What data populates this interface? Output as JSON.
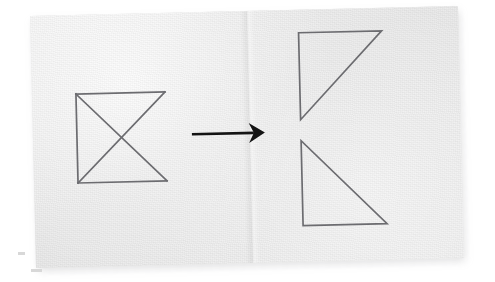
{
  "scene": {
    "kind": "photograph-of-drawing",
    "description": "Hand-drawn geometry transformation diagram on a lightly textured gray sheet, photographed at a slight counter-clockwise tilt on a white surface",
    "page_background_color": "#ffffff",
    "paper_color": "#ebebeb",
    "paper_rotation_deg": -1.35,
    "ink_color": "#6c6c70",
    "arrow_color": "#141414"
  },
  "figures": {
    "left": {
      "name": "square-with-both-diagonals-open-right",
      "label": "source figure",
      "bounds": {
        "x": 76,
        "y": 88,
        "width": 89,
        "height": 89
      },
      "edges": [
        "top",
        "left",
        "bottom",
        "diagonal-tl-br",
        "diagonal-bl-tr"
      ],
      "missing_edges": [
        "right"
      ],
      "svg_paths": [
        "M 76 88 L 165 88",
        "M 76 88 L 76 177",
        "M 76 177 L 165 177",
        "M 76 88 L 165 177",
        "M 76 177 L 165 88"
      ]
    },
    "right_top": {
      "name": "upper-right-triangle",
      "label": "result figure, upper triangle",
      "vertices": [
        [
          300,
          33
        ],
        [
          383,
          33
        ],
        [
          300,
          119
        ]
      ],
      "right_angle_at": "top-left",
      "svg_path": "M 300 33 L 383 33 L 300 119 Z"
    },
    "right_bottom": {
      "name": "lower-right-triangle",
      "label": "result figure, lower triangle",
      "vertices": [
        [
          300,
          140
        ],
        [
          300,
          225
        ],
        [
          384,
          225
        ]
      ],
      "right_angle_at": "bottom-left",
      "svg_path": "M 300 140 L 300 225 L 384 225 Z"
    }
  },
  "arrow": {
    "name": "transformation-arrow",
    "direction": "right",
    "shaft": {
      "x1": 191,
      "y1": 131,
      "x2": 252,
      "y2": 131
    },
    "head_points": "248,122 263,131 248,140 252,131",
    "color": "#141414"
  },
  "text": {
    "visible_text": "",
    "note": "No text, labels, axis ticks, or captions appear anywhere in the image"
  }
}
